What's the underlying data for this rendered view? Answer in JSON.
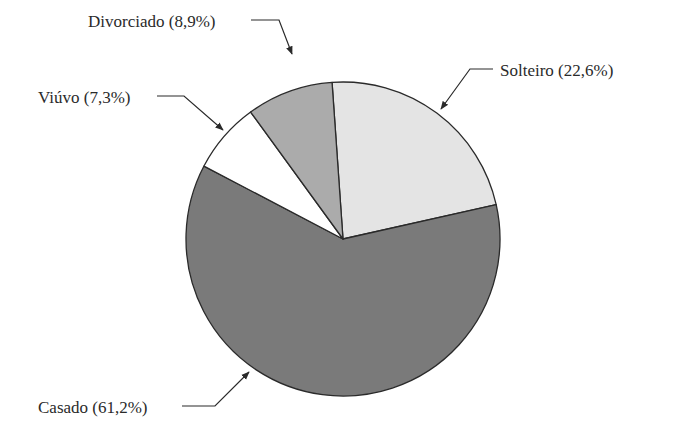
{
  "chart_data": {
    "type": "pie",
    "title": "",
    "categories": [
      "Solteiro",
      "Casado",
      "Viúvo",
      "Divorciado"
    ],
    "values": [
      22.6,
      61.2,
      7.3,
      8.9
    ],
    "unit": "%",
    "labels": [
      "Solteiro (22,6%)",
      "Casado (61,2%)",
      "Viúvo (7,3%)",
      "Divorciado (8,9%)"
    ],
    "colors": [
      "#e4e4e4",
      "#7a7a7a",
      "#ffffff",
      "#ababab"
    ],
    "start_angle_deg_from_top_clockwise": -4,
    "legend": "none (callout labels with arrows)"
  }
}
